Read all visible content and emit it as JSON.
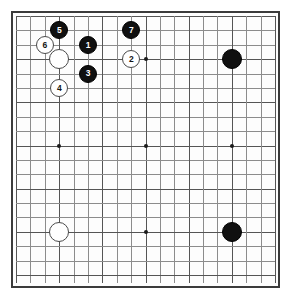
{
  "diagram": {
    "title": "Go game opening diagram",
    "board_size": 19,
    "background_color": "#ffffff",
    "board_color": "#fdfdfd",
    "border_color": "#3b3b3b",
    "grid_color": "#8c8c8c",
    "black_color": "#101010",
    "white_color": "#ffffff"
  },
  "board": {
    "columns": 19,
    "rows": 19,
    "star_points": [
      {
        "col": 3,
        "row": 3
      },
      {
        "col": 9,
        "row": 3
      },
      {
        "col": 15,
        "row": 3
      },
      {
        "col": 3,
        "row": 9
      },
      {
        "col": 9,
        "row": 9
      },
      {
        "col": 15,
        "row": 9
      },
      {
        "col": 3,
        "row": 15
      },
      {
        "col": 9,
        "row": 15
      },
      {
        "col": 15,
        "row": 15
      }
    ]
  },
  "stones": [
    {
      "id": "stone-move-5",
      "color": "black",
      "label": "5",
      "col": 3,
      "row": 1,
      "size": "num"
    },
    {
      "id": "stone-move-7",
      "color": "black",
      "label": "7",
      "col": 8,
      "row": 1,
      "size": "num"
    },
    {
      "id": "stone-move-6",
      "color": "white",
      "label": "6",
      "col": 2,
      "row": 2,
      "size": "num"
    },
    {
      "id": "stone-move-1",
      "color": "black",
      "label": "1",
      "col": 5,
      "row": 2,
      "size": "num"
    },
    {
      "id": "stone-white-handicap-upper-left",
      "color": "white",
      "label": "",
      "col": 3,
      "row": 3,
      "size": "big"
    },
    {
      "id": "stone-move-2",
      "color": "white",
      "label": "2",
      "col": 8,
      "row": 3,
      "size": "num"
    },
    {
      "id": "stone-black-handicap-upper-right",
      "color": "black",
      "label": "",
      "col": 15,
      "row": 3,
      "size": "big"
    },
    {
      "id": "stone-move-3",
      "color": "black",
      "label": "3",
      "col": 5,
      "row": 4,
      "size": "num"
    },
    {
      "id": "stone-move-4",
      "color": "white",
      "label": "4",
      "col": 3,
      "row": 5,
      "size": "num"
    },
    {
      "id": "stone-white-handicap-lower-left",
      "color": "white",
      "label": "",
      "col": 3,
      "row": 15,
      "size": "big"
    },
    {
      "id": "stone-black-handicap-lower-right",
      "color": "black",
      "label": "",
      "col": 15,
      "row": 15,
      "size": "big"
    }
  ]
}
